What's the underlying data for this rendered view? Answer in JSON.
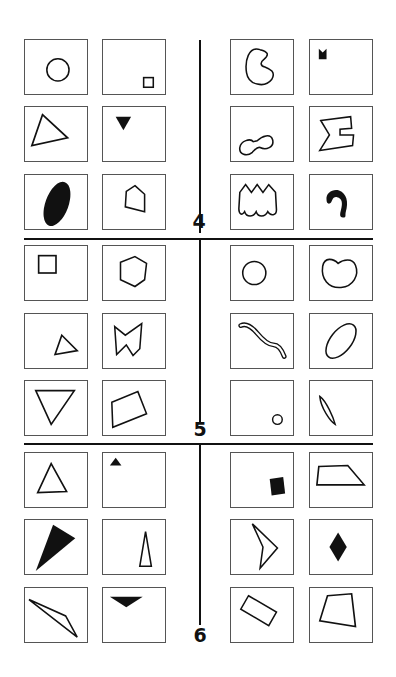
{
  "sections": [
    {
      "label": "4",
      "left_panels": [
        {
          "shape": "circle-outline"
        },
        {
          "shape": "small-square-outline-bottom-right"
        },
        {
          "shape": "triangle-outline"
        },
        {
          "shape": "inverted-triangle-filled-small"
        },
        {
          "shape": "ellipse-filled-tilted"
        },
        {
          "shape": "pentagon-outline"
        }
      ],
      "right_panels": [
        {
          "shape": "kidney-c-outline"
        },
        {
          "shape": "notched-square-filled-small"
        },
        {
          "shape": "peanut-outline"
        },
        {
          "shape": "sigma-like-outline"
        },
        {
          "shape": "crown-scalloped-outline"
        },
        {
          "shape": "hook-filled"
        }
      ]
    },
    {
      "label": "5",
      "left_panels": [
        {
          "shape": "square-outline-top-left"
        },
        {
          "shape": "hexagon-outline"
        },
        {
          "shape": "small-triangle-outline"
        },
        {
          "shape": "bowtie-polygon-outline"
        },
        {
          "shape": "inverted-triangle-outline"
        },
        {
          "shape": "quadrilateral-outline"
        }
      ],
      "right_panels": [
        {
          "shape": "circle-outline"
        },
        {
          "shape": "bean-outline"
        },
        {
          "shape": "wavy-worm-outline"
        },
        {
          "shape": "ellipse-outline-tilted"
        },
        {
          "shape": "small-circle-outline"
        },
        {
          "shape": "narrow-lens-outline"
        }
      ]
    },
    {
      "label": "6",
      "left_panels": [
        {
          "shape": "triangle-outline"
        },
        {
          "shape": "small-triangle-filled"
        },
        {
          "shape": "large-triangle-filled"
        },
        {
          "shape": "tall-thin-triangle-outline"
        },
        {
          "shape": "sliver-triangle-outline"
        },
        {
          "shape": "inverted-triangle-filled-wide"
        }
      ],
      "right_panels": [
        {
          "shape": "square-filled-rotated"
        },
        {
          "shape": "trapezoid-outline"
        },
        {
          "shape": "arrowhead-outline"
        },
        {
          "shape": "diamond-filled"
        },
        {
          "shape": "rectangle-outline-rotated"
        },
        {
          "shape": "quadrilateral-outline"
        }
      ]
    }
  ]
}
